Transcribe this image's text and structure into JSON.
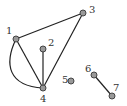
{
  "graph": {
    "nodes": [
      {
        "id": "1",
        "label": "1",
        "x": 16,
        "y": 39,
        "lx": 6,
        "ly": 34
      },
      {
        "id": "2",
        "label": "2",
        "x": 43,
        "y": 49,
        "lx": 48,
        "ly": 46
      },
      {
        "id": "3",
        "label": "3",
        "x": 83,
        "y": 13,
        "lx": 89,
        "ly": 13
      },
      {
        "id": "4",
        "label": "4",
        "x": 43,
        "y": 88,
        "lx": 40,
        "ly": 102
      },
      {
        "id": "5",
        "label": "5",
        "x": 71,
        "y": 81,
        "lx": 62,
        "ly": 83
      },
      {
        "id": "6",
        "label": "6",
        "x": 94,
        "y": 75,
        "lx": 85,
        "ly": 72
      },
      {
        "id": "7",
        "label": "7",
        "x": 112,
        "y": 96,
        "lx": 113,
        "ly": 91
      }
    ],
    "edges": [
      {
        "from": "1",
        "to": "3"
      },
      {
        "from": "1",
        "to": "4"
      },
      {
        "from": "1",
        "to": "4",
        "curved": true
      },
      {
        "from": "2",
        "to": "4"
      },
      {
        "from": "3",
        "to": "4"
      },
      {
        "from": "6",
        "to": "7"
      }
    ],
    "colors": {
      "node_fill": "#999999",
      "node_stroke": "#444444",
      "edge": "#222222"
    }
  }
}
